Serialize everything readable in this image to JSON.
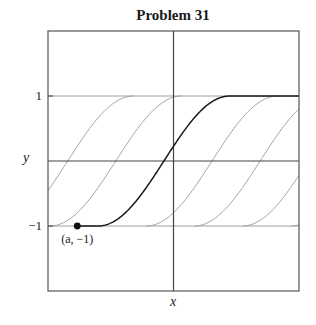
{
  "chart_data": {
    "type": "line",
    "title": "Problem 31",
    "xlabel": "x",
    "ylabel": "y",
    "ylim": [
      -2,
      2
    ],
    "xlim": [
      -3,
      3
    ],
    "y_ticks": [
      {
        "value": 1,
        "label": "1"
      },
      {
        "value": -1,
        "label": "−1"
      }
    ],
    "grid": false,
    "frame": true,
    "axes_lines": {
      "x_axis_at_y": 0,
      "y_axis_at_x": 0
    },
    "reference_lines": [
      {
        "y": 1,
        "color": "#a0a0a0"
      },
      {
        "y": -1,
        "color": "#a0a0a0"
      }
    ],
    "curve_shape": "solution curves of dy/dx = sqrt(1 - y^2): y = -1 for x <= a, y = sin(x - a - pi/2) for a <= x <= a + pi, y = 1 for x >= a + pi",
    "highlighted_curve": {
      "a": -1.8,
      "color": "#1a1a1a"
    },
    "family_shifts_a": [
      -4.1,
      -2.95,
      -1.8,
      -0.65,
      0.5,
      1.65,
      2.8
    ],
    "family_color": "#9a9a9a",
    "point": {
      "x": -2.3,
      "y": -1,
      "label": "(a, −1)"
    }
  }
}
